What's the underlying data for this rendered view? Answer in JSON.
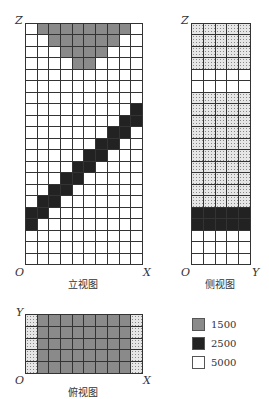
{
  "front_view": {
    "caption": "立视图",
    "axis_vertical": "Z",
    "axis_horizontal": "X",
    "origin": "O",
    "cols": 10,
    "rows": [
      "wggggggggw",
      "wwggggggww",
      "wwwggggwww",
      "wwwwggwwww",
      "wwwwwwwwww",
      "wwwwwwwwww",
      "wwwwwwwwww",
      "wwwwwwwwwb",
      "wwwwwwwwbb",
      "wwwwwwwbbw",
      "wwwwwwbbww",
      "wwwwwbbwww",
      "wwwwbbwwww",
      "wwwbbwwwww",
      "wwbbwwwwww",
      "wbbwwwwwww",
      "bbwwwwwwww",
      "bwwwwwwwww",
      "wwwwwwwwww",
      "wwwwwwwwww",
      "wwwwwwwwww"
    ]
  },
  "side_view": {
    "caption": "侧视图",
    "axis_vertical": "Z",
    "axis_horizontal": "Y",
    "origin": "O",
    "cols": 5,
    "rows": [
      "ddddd",
      "ddddd",
      "ddddd",
      "ddddd",
      "wwwww",
      "wwwww",
      "ddddd",
      "ddddd",
      "ddddd",
      "ddddd",
      "ddddd",
      "ddddd",
      "ddddd",
      "ddddd",
      "ddddd",
      "ddddd",
      "bbbbb",
      "bbbbb",
      "wwwww",
      "wwwww",
      "wwwww"
    ]
  },
  "top_view": {
    "caption": "俯视图",
    "axis_vertical": "Y",
    "axis_horizontal": "X",
    "origin": "O",
    "cols": 10,
    "rows": [
      "dggggggggd",
      "dggggggggd",
      "dggggggggd",
      "dggggggggd",
      "dggggggggd"
    ]
  },
  "legend": [
    {
      "key": "g",
      "label": "1500",
      "color": "#8a8a8a"
    },
    {
      "key": "b",
      "label": "2500",
      "color": "#222222"
    },
    {
      "key": "w",
      "label": "5000",
      "color": "#ffffff"
    }
  ]
}
